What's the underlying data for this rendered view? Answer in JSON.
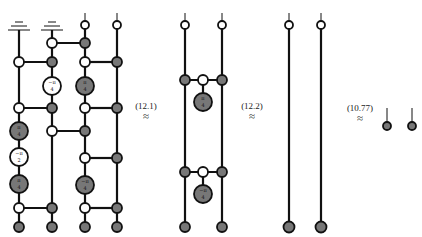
{
  "diagram": {
    "type": "zx-calculus-rewrite",
    "colors": {
      "wire": "#111111",
      "z_spider": "#ffffff",
      "x_spider": "#777777",
      "stroke": "#111111"
    },
    "equations": [
      {
        "label": "(12.1)",
        "symbol": "≈"
      },
      {
        "label": "(12.2)",
        "symbol": "≈"
      },
      {
        "label": "(10.77)",
        "symbol": "≈"
      }
    ],
    "panel1": {
      "description": "Four-qubit circuit with two ground inputs on left wires, white and gray spiders connected by CNOT-like edges",
      "phases": {
        "col2_white": "-π/4",
        "col3_gray": "π/4",
        "col1_gray_top": "π/4",
        "col1_white": "-π/2",
        "col1_gray_bottom": "π/4",
        "col3_gray_bottom": "-π/4"
      }
    },
    "panel2": {
      "description": "Two wires with two gray-white-gray connections each hanging a phase spider",
      "phases": {
        "top": "π/4",
        "bottom": "-π/4"
      }
    },
    "panel3": {
      "description": "Two straight wires, white top, gray bottom"
    },
    "panel4": {
      "description": "Two disconnected gray spiders with short wires"
    }
  }
}
